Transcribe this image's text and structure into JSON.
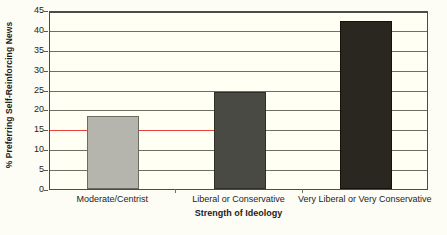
{
  "chart_data": {
    "type": "bar",
    "title": "",
    "xlabel": "Strength of Ideology",
    "ylabel": "% Preferring Self-Reinforcing News",
    "categories": [
      "Moderate/Centrist",
      "Liberal or Conservative",
      "Very Liberal or Very Conservative"
    ],
    "values": [
      18.3,
      24.3,
      42.2
    ],
    "bar_colors": [
      "#b5b5ad",
      "#4a4a44",
      "#2a2620"
    ],
    "bar_border_colors": [
      "#6b6b63",
      "#2f2f2a",
      "#15120e"
    ],
    "ylim": [
      0,
      45
    ],
    "ytick_values": [
      0,
      5,
      10,
      15,
      20,
      25,
      30,
      35,
      40,
      45
    ],
    "ytick_labels": [
      "0",
      "5",
      "10",
      "15",
      "20",
      "25",
      "30",
      "35",
      "40",
      "45"
    ],
    "grid": true,
    "legend": "none",
    "annotations": [
      {
        "name": "reference-line",
        "value": 15,
        "color": "#e8403a",
        "description": "Red horizontal reference line at 15%"
      }
    ]
  },
  "axes": {
    "y_title": "% Preferring Self-Reinforcing News",
    "x_title": "Strength of Ideology"
  }
}
